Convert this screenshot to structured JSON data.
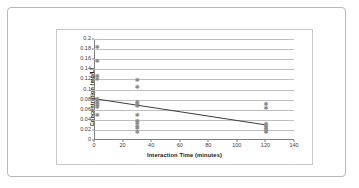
{
  "figure": {
    "border_color": "#b9b9b9",
    "background": "#ffffff"
  },
  "chart_data": {
    "type": "scatter",
    "title": "",
    "xlabel": "Interaction Time (minutes)",
    "ylabel": "Concentration  (mg/L)",
    "xlim": [
      0,
      140
    ],
    "ylim": [
      0,
      0.2
    ],
    "grid": true,
    "legend": "none",
    "xticks": [
      0,
      20,
      40,
      60,
      80,
      100,
      120,
      140
    ],
    "xtick_labels": [
      "0",
      "20",
      "40",
      "60",
      "80",
      "100",
      "120",
      "140"
    ],
    "yticks": [
      0,
      0.02,
      0.04,
      0.06,
      0.08,
      0.1,
      0.12,
      0.14,
      0.16,
      0.18,
      0.2
    ],
    "ytick_labels": [
      "0",
      "0.02",
      "0.04",
      "0.06",
      "0.08",
      "0.1",
      "0.12",
      "0.14",
      "0.16",
      "0.18",
      "0.2"
    ],
    "marker": "asterisk",
    "marker_color": "#8a8a8a",
    "series": [
      {
        "name": "Concentration measurements",
        "points": [
          {
            "x": 2,
            "y": 0.185
          },
          {
            "x": 2,
            "y": 0.156
          },
          {
            "x": 2,
            "y": 0.127
          },
          {
            "x": 2,
            "y": 0.121
          },
          {
            "x": 2,
            "y": 0.082
          },
          {
            "x": 2,
            "y": 0.078
          },
          {
            "x": 2,
            "y": 0.074
          },
          {
            "x": 2,
            "y": 0.07
          },
          {
            "x": 2,
            "y": 0.066
          },
          {
            "x": 2,
            "y": 0.049
          },
          {
            "x": 30,
            "y": 0.118
          },
          {
            "x": 30,
            "y": 0.104
          },
          {
            "x": 30,
            "y": 0.075
          },
          {
            "x": 30,
            "y": 0.071
          },
          {
            "x": 30,
            "y": 0.067
          },
          {
            "x": 30,
            "y": 0.05
          },
          {
            "x": 30,
            "y": 0.038
          },
          {
            "x": 30,
            "y": 0.033
          },
          {
            "x": 30,
            "y": 0.028
          },
          {
            "x": 30,
            "y": 0.023
          },
          {
            "x": 30,
            "y": 0.016
          },
          {
            "x": 120,
            "y": 0.071
          },
          {
            "x": 120,
            "y": 0.063
          },
          {
            "x": 120,
            "y": 0.031
          },
          {
            "x": 120,
            "y": 0.027
          },
          {
            "x": 120,
            "y": 0.023
          },
          {
            "x": 120,
            "y": 0.019
          },
          {
            "x": 120,
            "y": 0.015
          }
        ]
      }
    ],
    "trendline": {
      "name": "linear trend",
      "color": "#3c3c3c",
      "x0": 0,
      "y0": 0.082,
      "x1": 120,
      "y1": 0.03
    }
  }
}
